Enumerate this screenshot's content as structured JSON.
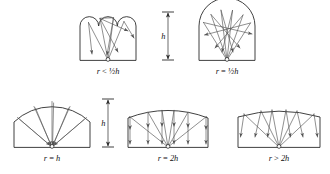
{
  "figure": {
    "background_color": "#ffffff",
    "outline_color": "#2b2b2b",
    "ray_color": "#545454"
  },
  "dimensions": [
    {
      "label": "h",
      "name": "height-dimension-top",
      "x": 168,
      "y_top": 12,
      "y_bottom": 60
    },
    {
      "label": "h",
      "name": "height-dimension-bottom",
      "x": 108,
      "y_top": 99,
      "y_bottom": 147
    }
  ],
  "panels": [
    {
      "id": "panel-r-lt-half-h",
      "caption": "r < ½h",
      "caption_parts": {
        "var": "r",
        "relation": "<",
        "value": "½h"
      },
      "description": "Scalloped ceiling of three small arcs; rays from the source scatter widely after reflection.",
      "caption_x": 108,
      "caption_y": 74,
      "room": {
        "left": 80,
        "right": 136,
        "floor": 60,
        "wall_top": 26
      },
      "ceiling_type": "scalloped",
      "scallop_count": 3,
      "radius_note": "r < 1/2 h",
      "source": {
        "x": 108,
        "y": 60
      }
    },
    {
      "id": "panel-r-eq-half-h",
      "caption": "r = ½h",
      "caption_parts": {
        "var": "r",
        "relation": "=",
        "value": "½h"
      },
      "description": "Single semicircular dome of radius one half the height; rays cross near the centre then spread downward.",
      "caption_x": 227,
      "caption_y": 74,
      "room": {
        "left": 199,
        "right": 255,
        "floor": 60,
        "wall_top": 26
      },
      "ceiling_type": "dome",
      "radius_note": "r = 1/2 h",
      "source": {
        "x": 227,
        "y": 60
      }
    },
    {
      "id": "panel-r-eq-h",
      "caption": "r = h",
      "caption_parts": {
        "var": "r",
        "relation": "=",
        "value": "h"
      },
      "description": "Shallow arc of radius equal to the height; all reflected rays return to the source point.",
      "caption_x": 52,
      "caption_y": 161,
      "room": {
        "left": 14,
        "right": 90,
        "floor": 147,
        "wall_top": 122
      },
      "ceiling_type": "shallow-arc",
      "radius_note": "r = h",
      "source": {
        "x": 52,
        "y": 147
      }
    },
    {
      "id": "panel-r-eq-2h",
      "caption": "r = 2h",
      "caption_parts": {
        "var": "r",
        "relation": "=",
        "value": "2h"
      },
      "description": "Very shallow arc of radius twice the height; reflected rays leave vertically as a parallel bundle.",
      "caption_x": 168,
      "caption_y": 161,
      "room": {
        "left": 128,
        "right": 208,
        "floor": 147,
        "wall_top": 114
      },
      "ceiling_type": "flat-arc",
      "radius_note": "r = 2h",
      "source": {
        "x": 168,
        "y": 147
      }
    },
    {
      "id": "panel-r-gt-2h",
      "caption": "r > 2h",
      "caption_parts": {
        "var": "r",
        "relation": ">",
        "value": "2h"
      },
      "description": "Nearly flat ceiling with radius greater than twice the height; reflected rays diverge outward.",
      "caption_x": 279,
      "caption_y": 161,
      "room": {
        "left": 238,
        "right": 320,
        "floor": 147,
        "wall_top": 113
      },
      "ceiling_type": "flat-arc",
      "radius_note": "r > 2h",
      "source": {
        "x": 279,
        "y": 147
      }
    }
  ]
}
